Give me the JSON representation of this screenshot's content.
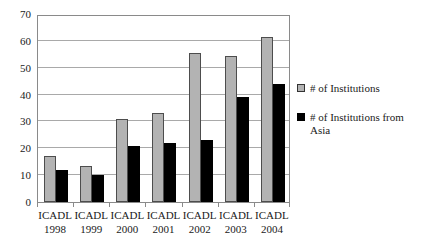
{
  "chart_data": {
    "type": "bar",
    "title": "",
    "xlabel": "",
    "ylabel": "",
    "ylim": [
      0,
      70
    ],
    "ytick_step": 10,
    "yticks": [
      70,
      60,
      50,
      40,
      30,
      20,
      10,
      0
    ],
    "grid": true,
    "legend_position": "right",
    "categories": [
      {
        "name": "ICADL",
        "year": "1998"
      },
      {
        "name": "ICADL",
        "year": "1999"
      },
      {
        "name": "ICADL",
        "year": "2000"
      },
      {
        "name": "ICADL",
        "year": "2001"
      },
      {
        "name": "ICADL",
        "year": "2002"
      },
      {
        "name": "ICADL",
        "year": "2003"
      },
      {
        "name": "ICADL",
        "year": "2004"
      }
    ],
    "series": [
      {
        "name": "# of Institutions",
        "color": "#b3b3b3",
        "values": [
          17,
          13.5,
          31,
          33,
          55.5,
          54.5,
          61.5
        ]
      },
      {
        "name": "# of Institutions from Asia",
        "color": "#000000",
        "values": [
          12,
          10,
          21,
          22,
          23,
          39,
          44
        ]
      }
    ]
  },
  "legend": {
    "entries": [
      {
        "label": "# of Institutions"
      },
      {
        "label": "# of Institutions from Asia"
      }
    ]
  }
}
